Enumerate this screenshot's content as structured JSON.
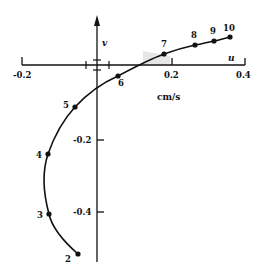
{
  "figure": {
    "axes": {
      "x_name": "u",
      "y_name": "v",
      "unit": "cm/s",
      "x_ticks": [
        "-0.2",
        "0.2",
        "0.4"
      ],
      "y_ticks": [
        "-0.2",
        "-0.4"
      ]
    },
    "points": [
      {
        "label": "2",
        "u": -0.05,
        "v": -0.52
      },
      {
        "label": "3",
        "u": -0.13,
        "v": -0.41
      },
      {
        "label": "4",
        "u": -0.13,
        "v": -0.24
      },
      {
        "label": "5",
        "u": -0.06,
        "v": -0.11
      },
      {
        "label": "6",
        "u": 0.06,
        "v": -0.03
      },
      {
        "label": "7",
        "u": 0.18,
        "v": 0.03
      },
      {
        "label": "8",
        "u": 0.26,
        "v": 0.055
      },
      {
        "label": "9",
        "u": 0.31,
        "v": 0.065
      },
      {
        "label": "10",
        "u": 0.355,
        "v": 0.075
      }
    ],
    "colors": {
      "ink": "#111111",
      "background": "#ffffff"
    }
  }
}
